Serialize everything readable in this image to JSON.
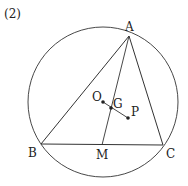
{
  "figure": {
    "number_label": "(2)",
    "stroke_color": "#333333",
    "circle": {
      "cx": 103,
      "cy": 102,
      "r": 75
    },
    "points": {
      "A": {
        "label": "A",
        "x": 129,
        "y": 36,
        "lx": 125,
        "ly": 31
      },
      "B": {
        "label": "B",
        "x": 41,
        "y": 144,
        "lx": 28,
        "ly": 157
      },
      "C": {
        "label": "C",
        "x": 163,
        "y": 145,
        "lx": 166,
        "ly": 158
      },
      "M": {
        "label": "M",
        "x": 102,
        "y": 145,
        "lx": 96,
        "ly": 159
      },
      "O": {
        "label": "O",
        "x": 103,
        "y": 102,
        "lx": 92,
        "ly": 101
      },
      "G": {
        "label": "G",
        "x": 111,
        "y": 108,
        "lx": 113,
        "ly": 108
      },
      "P": {
        "label": "P",
        "x": 128,
        "y": 118,
        "lx": 131,
        "ly": 116
      }
    },
    "segments": [
      [
        "A",
        "B"
      ],
      [
        "B",
        "C"
      ],
      [
        "C",
        "A"
      ],
      [
        "A",
        "M"
      ],
      [
        "O",
        "P"
      ]
    ],
    "dots": [
      "O",
      "G",
      "P"
    ]
  }
}
